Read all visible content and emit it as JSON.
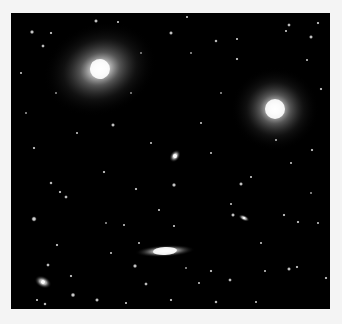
{
  "image": {
    "caption": "Deep-sky field with galaxies and stars",
    "background": "#000000",
    "margin_color": "#f4f4f4",
    "galaxies": [
      {
        "name": "elliptical-galaxy-large-left",
        "cx": 89,
        "cy": 56,
        "rx": 58,
        "ry": 46,
        "rot": -20,
        "core": 10
      },
      {
        "name": "elliptical-galaxy-large-right",
        "cx": 264,
        "cy": 96,
        "rx": 44,
        "ry": 42,
        "rot": 0,
        "core": 10
      },
      {
        "name": "edge-on-spiral-galaxy",
        "cx": 154,
        "cy": 238,
        "rx": 30,
        "ry": 6,
        "rot": -3,
        "core": 4
      },
      {
        "name": "small-galaxy-center",
        "cx": 164,
        "cy": 143,
        "rx": 7,
        "ry": 5,
        "rot": -55,
        "core": 2
      },
      {
        "name": "small-galaxy-bottom-left",
        "cx": 32,
        "cy": 269,
        "rx": 9,
        "ry": 6,
        "rot": 25,
        "core": 2
      },
      {
        "name": "small-galaxy-right",
        "cx": 233,
        "cy": 205,
        "rx": 6,
        "ry": 3,
        "rot": 25,
        "core": 1
      }
    ],
    "stars": [
      [
        21,
        19,
        1.4
      ],
      [
        32,
        33,
        1.2
      ],
      [
        40,
        20,
        1.0
      ],
      [
        85,
        8,
        1.3
      ],
      [
        107,
        9,
        0.9
      ],
      [
        160,
        20,
        1.3
      ],
      [
        176,
        4,
        0.9
      ],
      [
        205,
        28,
        1.1
      ],
      [
        226,
        26,
        0.9
      ],
      [
        278,
        12,
        1.2
      ],
      [
        300,
        24,
        1.3
      ],
      [
        307,
        10,
        1.0
      ],
      [
        296,
        47,
        0.8
      ],
      [
        23,
        135,
        1.0
      ],
      [
        40,
        170,
        1.1
      ],
      [
        49,
        179,
        1.0
      ],
      [
        55,
        184,
        1.2
      ],
      [
        23,
        206,
        1.7
      ],
      [
        102,
        112,
        1.3
      ],
      [
        93,
        159,
        1.0
      ],
      [
        125,
        176,
        1.0
      ],
      [
        163,
        172,
        1.4
      ],
      [
        113,
        212,
        0.8
      ],
      [
        148,
        197,
        0.9
      ],
      [
        128,
        230,
        0.8
      ],
      [
        37,
        252,
        1.2
      ],
      [
        46,
        232,
        1.0
      ],
      [
        60,
        263,
        1.0
      ],
      [
        163,
        213,
        0.9
      ],
      [
        220,
        191,
        0.8
      ],
      [
        226,
        46,
        1.0
      ],
      [
        275,
        18,
        0.9
      ],
      [
        310,
        76,
        1.0
      ],
      [
        301,
        137,
        1.0
      ],
      [
        265,
        127,
        0.9
      ],
      [
        222,
        202,
        1.3
      ],
      [
        230,
        171,
        1.3
      ],
      [
        240,
        164,
        0.9
      ],
      [
        273,
        202,
        1.0
      ],
      [
        287,
        209,
        1.0
      ],
      [
        307,
        210,
        0.8
      ],
      [
        278,
        256,
        1.3
      ],
      [
        286,
        254,
        1.0
      ],
      [
        219,
        267,
        1.2
      ],
      [
        205,
        289,
        1.1
      ],
      [
        254,
        258,
        0.8
      ],
      [
        245,
        289,
        0.8
      ],
      [
        124,
        253,
        1.4
      ],
      [
        135,
        271,
        1.2
      ],
      [
        86,
        287,
        1.3
      ],
      [
        62,
        282,
        1.5
      ],
      [
        34,
        291,
        1.1
      ],
      [
        26,
        287,
        0.9
      ],
      [
        160,
        287,
        1.0
      ],
      [
        188,
        270,
        0.8
      ],
      [
        200,
        258,
        1.0
      ],
      [
        315,
        265,
        1.0
      ],
      [
        300,
        297,
        0.8
      ],
      [
        115,
        290,
        0.9
      ],
      [
        66,
        120,
        0.8
      ],
      [
        140,
        130,
        0.8
      ],
      [
        190,
        110,
        0.8
      ],
      [
        200,
        140,
        0.8
      ],
      [
        250,
        230,
        0.8
      ],
      [
        100,
        240,
        0.8
      ],
      [
        180,
        40,
        0.7
      ],
      [
        130,
        40,
        0.7
      ],
      [
        10,
        60,
        0.8
      ],
      [
        45,
        80,
        0.7
      ],
      [
        210,
        80,
        0.7
      ],
      [
        280,
        150,
        0.8
      ],
      [
        15,
        100,
        0.7
      ],
      [
        95,
        210,
        0.7
      ],
      [
        175,
        255,
        0.7
      ],
      [
        300,
        180,
        0.7
      ],
      [
        320,
        120,
        0.7
      ],
      [
        120,
        80,
        0.7
      ]
    ]
  }
}
